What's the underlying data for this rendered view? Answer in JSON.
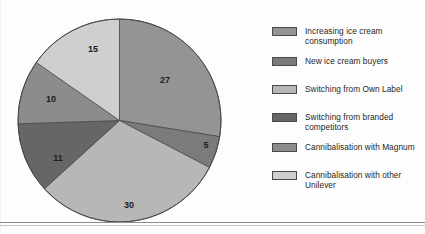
{
  "chart_data": {
    "type": "pie",
    "title": "",
    "labels": [
      "Increasing ice cream consumption",
      "New ice cream buyers",
      "Switching from Own Label",
      "Switching from branded competitors",
      "Cannibalisation with Magnum",
      "Cannibalisation with other Unilever"
    ],
    "values": [
      27,
      5,
      30,
      11,
      10,
      15
    ],
    "value_labels": [
      "27",
      "5",
      "30",
      "11",
      "10",
      "15"
    ],
    "colors": [
      "#949494",
      "#7b7b7b",
      "#b7b7b7",
      "#666666",
      "#8c8c8c",
      "#cfcfcf"
    ],
    "start_angle_deg": 0,
    "direction": "clockwise",
    "legend_position": "right",
    "grid": false,
    "total": 98
  },
  "legend": {
    "items": [
      {
        "label": "Increasing ice cream consumption",
        "color": "#949494"
      },
      {
        "label": "New ice cream buyers",
        "color": "#7b7b7b"
      },
      {
        "label": "Switching from Own Label",
        "color": "#b7b7b7"
      },
      {
        "label": "Switching from branded competitors",
        "color": "#666666"
      },
      {
        "label": "Cannibalisation with Magnum",
        "color": "#8c8c8c"
      },
      {
        "label": "Cannibalisation with other Unilever",
        "color": "#cfcfcf"
      }
    ]
  },
  "slice_labels": [
    {
      "text": "27",
      "x": 148,
      "y": 63
    },
    {
      "text": "5",
      "x": 189,
      "y": 128
    },
    {
      "text": "30",
      "x": 112,
      "y": 188
    },
    {
      "text": "11",
      "x": 41,
      "y": 141
    },
    {
      "text": "10",
      "x": 34,
      "y": 82
    },
    {
      "text": "15",
      "x": 76,
      "y": 32
    }
  ],
  "colors": {
    "outline": "#4a4a4a",
    "rule": "#8d8d8d",
    "background": "#fdfdfd",
    "text": "#1f1f1f"
  }
}
